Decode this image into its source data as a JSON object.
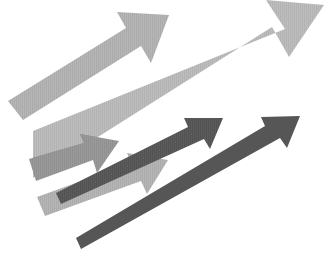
{
  "canvas": {
    "width": 335,
    "height": 253,
    "background": "#ffffff",
    "title": "Overlapping upward arrows graphic"
  },
  "palette": {
    "light_gray": "#b6b6b6",
    "light_gray_2": "#bdbdbd",
    "medium_gray": "#9a9a9a",
    "mid_shadow_gray": "#8a8a8a",
    "dark_gray": "#5c5c5c",
    "dark_gray_2": "#565656",
    "background": "#ffffff"
  },
  "graphic": {
    "type": "arrow-cluster",
    "direction": "up-right",
    "count": 6,
    "arrows": [
      {
        "id": "arrow-1",
        "name": "upper-left-light-arrow",
        "color": "#b6b6b6",
        "size": "large",
        "thickness": 26,
        "tail": [
          10,
          112
        ],
        "tip": [
          168,
          14
        ],
        "order": 1,
        "points": "8,101 125,28 116,12 168,14 150,61 140,45 22,119"
      },
      {
        "id": "arrow-2",
        "name": "main-large-light-arrow",
        "color": "#bdbdbd",
        "size": "extra-large",
        "thickness": 46,
        "tail": [
          33,
          131
        ],
        "tip": [
          323,
          8
        ],
        "order": 2,
        "points": "33,131 33,176 270,28 287,56 322,6 268,1 286,29 33,131"
      },
      {
        "id": "arrow-3",
        "name": "medium-gray-short-arrow",
        "color": "#9a9a9a",
        "size": "medium",
        "thickness": 18,
        "tail": [
          30,
          178
        ],
        "tip": [
          117,
          143
        ],
        "order": 3,
        "points": "30,160 82,144 78,136 117,142 96,172 92,160 38,180"
      },
      {
        "id": "arrow-4",
        "name": "lower-light-gray-arrow",
        "color": "#b6b6b6",
        "size": "medium",
        "thickness": 20,
        "tail": [
          36,
          208
        ],
        "tip": [
          166,
          162
        ],
        "order": 4,
        "points": "40,196 130,164 126,155 166,161 146,192 141,180 48,214"
      },
      {
        "id": "arrow-5",
        "name": "upper-dark-thin-arrow",
        "color": "#5c5c5c",
        "size": "small",
        "thickness": 9,
        "tail": [
          58,
          198
        ],
        "tip": [
          222,
          120
        ],
        "order": 5,
        "points": "57,194 190,127 186,119 222,119 209,148 203,140 62,204"
      },
      {
        "id": "arrow-6",
        "name": "lower-dark-thin-arrow",
        "color": "#565656",
        "size": "small",
        "thickness": 9,
        "tail": [
          78,
          243
        ],
        "tip": [
          298,
          118
        ],
        "order": 6,
        "points": "77,239 266,126 262,118 298,117 286,147 279,139 82,249"
      }
    ],
    "overlaps": [
      {
        "name": "arrow2-arrow3-shadow",
        "color": "#8a8a8a",
        "description": "darker blend where medium gray arrow crosses the large light arrow body"
      }
    ]
  }
}
